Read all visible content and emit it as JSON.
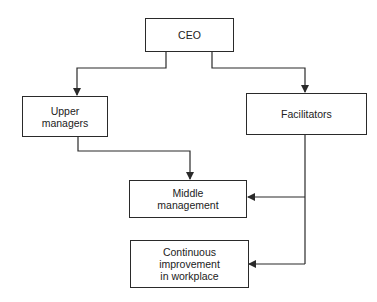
{
  "diagram": {
    "type": "org-flowchart",
    "nodes": [
      {
        "id": "ceo",
        "label": "CEO"
      },
      {
        "id": "upper",
        "label": "Upper\nmanagers"
      },
      {
        "id": "facilitators",
        "label": "Facilitators"
      },
      {
        "id": "middle",
        "label": "Middle\nmanagement"
      },
      {
        "id": "continuous",
        "label": "Continuous\nimprovement\nin workplace"
      }
    ],
    "edges": [
      {
        "from": "ceo",
        "to": "upper"
      },
      {
        "from": "ceo",
        "to": "facilitators"
      },
      {
        "from": "upper",
        "to": "middle"
      },
      {
        "from": "facilitators",
        "to": "middle"
      },
      {
        "from": "facilitators",
        "to": "continuous"
      }
    ]
  },
  "colors": {
    "line": "#2a2a2a",
    "background": "#ffffff"
  }
}
